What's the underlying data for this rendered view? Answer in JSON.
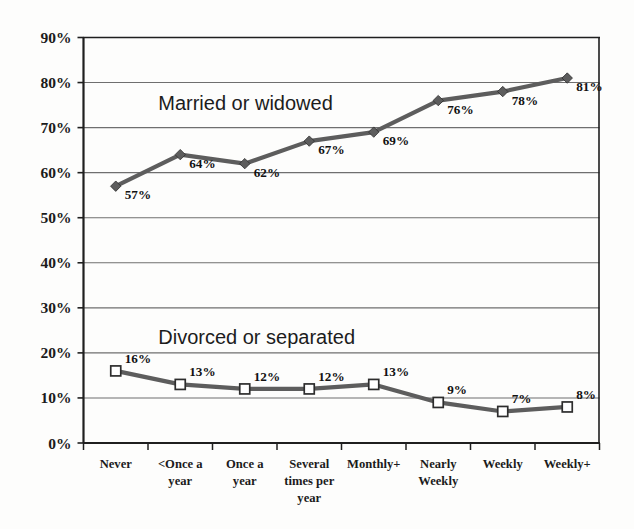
{
  "chart_data": {
    "type": "line",
    "title": "",
    "subtitle": "",
    "xlabel": "",
    "ylabel": "",
    "ylim": [
      0,
      90
    ],
    "ytick_labels": [
      "0%",
      "10%",
      "20%",
      "30%",
      "40%",
      "50%",
      "60%",
      "70%",
      "80%",
      "90%"
    ],
    "ytick_values": [
      0,
      10,
      20,
      30,
      40,
      50,
      60,
      70,
      80,
      90
    ],
    "grid": "horizontal",
    "legend_position": "inline-annotation",
    "categories": [
      "Never",
      "<Once a year",
      "Once a year",
      "Several times per year",
      "Monthly+",
      "Nearly Weekly",
      "Weekly",
      "Weekly+"
    ],
    "category_lines": [
      [
        "Never"
      ],
      [
        "<Once a",
        "year"
      ],
      [
        "Once a",
        "year"
      ],
      [
        "Several",
        "times per",
        "year"
      ],
      [
        "Monthly+"
      ],
      [
        "Nearly",
        "Weekly"
      ],
      [
        "Weekly"
      ],
      [
        "Weekly+"
      ]
    ],
    "series": [
      {
        "name": "Married or widowed",
        "marker": "diamond",
        "color": "#5d5d5d",
        "values": [
          57,
          64,
          62,
          67,
          69,
          76,
          78,
          81
        ],
        "labels": [
          "57%",
          "64%",
          "62%",
          "67%",
          "69%",
          "76%",
          "78%",
          "81%"
        ]
      },
      {
        "name": "Divorced or separated",
        "marker": "square",
        "color": "#5d5d5d",
        "values": [
          16,
          13,
          12,
          12,
          13,
          9,
          7,
          8
        ],
        "labels": [
          "16%",
          "13%",
          "12%",
          "12%",
          "13%",
          "9%",
          "7%",
          "8%"
        ]
      }
    ],
    "annotations": [
      {
        "text": "Married or widowed",
        "x_category": "<Once a year",
        "y_value": 74
      },
      {
        "text": "Divorced or separated",
        "x_category": "<Once a year",
        "y_value": 22
      }
    ]
  },
  "colors": {
    "line": "#5d5d5d",
    "marker_fill_square": "#ffffff",
    "marker_stroke": "#2d2d2d",
    "axis": "#1f1f1f",
    "gridline": "#6f6f6f",
    "text": "#1b1b1b",
    "background": "#fdfdfc"
  }
}
